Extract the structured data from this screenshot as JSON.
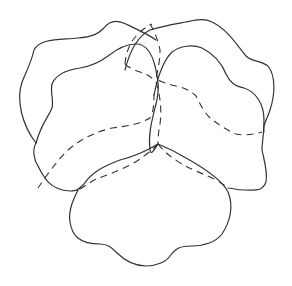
{
  "image": {
    "subject": "pansy flower line drawing",
    "background_color": "#ffffff",
    "stroke_color": "#333333",
    "elements": [
      {
        "name": "back-left-petal",
        "style": "solid"
      },
      {
        "name": "back-right-petal",
        "style": "solid"
      },
      {
        "name": "side-left-petal",
        "style": "solid"
      },
      {
        "name": "side-right-petal",
        "style": "solid"
      },
      {
        "name": "lower-petal",
        "style": "solid"
      },
      {
        "name": "hidden-petal-edges",
        "style": "dashed"
      }
    ]
  }
}
